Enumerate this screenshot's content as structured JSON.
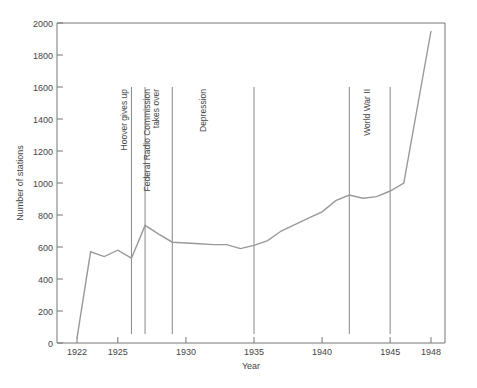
{
  "chart_data": {
    "type": "line",
    "title": "",
    "xlabel": "Year",
    "ylabel": "Number of stations",
    "xlim": [
      1920.5,
      1950.2
    ],
    "ylim": [
      0,
      2000
    ],
    "grid": false,
    "legend": null,
    "x_ticks": [
      1922,
      1925,
      1930,
      1935,
      1940,
      1945,
      1948
    ],
    "y_ticks": [
      0,
      200,
      400,
      600,
      800,
      1000,
      1200,
      1400,
      1600,
      1800,
      2000
    ],
    "series": [
      {
        "name": "Number of stations",
        "x": [
          1922,
          1923,
          1924,
          1925,
          1926,
          1927,
          1928,
          1929,
          1930,
          1931,
          1932,
          1933,
          1934,
          1935,
          1936,
          1937,
          1938,
          1939,
          1940,
          1941,
          1942,
          1943,
          1944,
          1945,
          1946,
          1948
        ],
        "values": [
          30,
          570,
          540,
          580,
          530,
          735,
          680,
          630,
          625,
          620,
          615,
          615,
          590,
          610,
          640,
          700,
          740,
          780,
          820,
          890,
          925,
          905,
          915,
          950,
          1000,
          1950
        ]
      }
    ],
    "annotations": [
      {
        "year": 1926,
        "label": "Hoover gives up",
        "line_top": 1600
      },
      {
        "year": 1927,
        "label": "Federal Radio Commission takes over",
        "label_lines": [
          "Federal Radio Commission",
          "takes over"
        ],
        "line_top": 1600
      },
      {
        "year": 1929,
        "label": "",
        "line_top": 1600
      },
      {
        "year": 1931.5,
        "label": "Depression",
        "text_only": true
      },
      {
        "year": 1935,
        "label": "",
        "line_top": 1600
      },
      {
        "year": 1942,
        "label": "",
        "line_top": 1600
      },
      {
        "year": 1943.5,
        "label": "World War II",
        "text_only": true
      },
      {
        "year": 1945,
        "label": "",
        "line_top": 1600
      }
    ]
  }
}
